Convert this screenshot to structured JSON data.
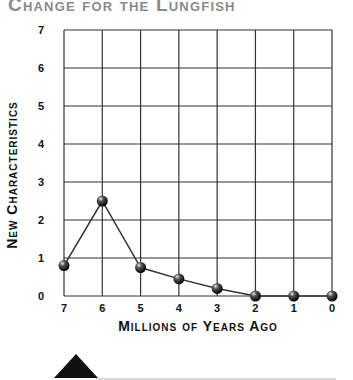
{
  "title": "Change for the Lungfish",
  "chart_data": {
    "type": "line",
    "title": "Change for the Lungfish",
    "xlabel": "Millions of Years Ago",
    "ylabel": "New Characteristics",
    "x": [
      7,
      6,
      5,
      4,
      3,
      2,
      1,
      0
    ],
    "x_tick_labels": [
      "7",
      "6",
      "5",
      "4",
      "3",
      "2",
      "1",
      "0"
    ],
    "y_tick_labels": [
      "0",
      "1",
      "2",
      "3",
      "4",
      "5",
      "6",
      "7"
    ],
    "series": [
      {
        "name": "Lungfish",
        "values": [
          0.8,
          2.5,
          0.75,
          0.45,
          0.2,
          0,
          0,
          0
        ]
      }
    ],
    "xlim": [
      7,
      0
    ],
    "ylim": [
      0,
      7
    ],
    "grid": true,
    "legend": "none",
    "marker": "sphere"
  },
  "colors": {
    "title": "#8a8a8a",
    "grid": "#333333",
    "line": "#333333",
    "marker": "#111111"
  },
  "decoration": {
    "icon": "diamond-marker-icon"
  }
}
